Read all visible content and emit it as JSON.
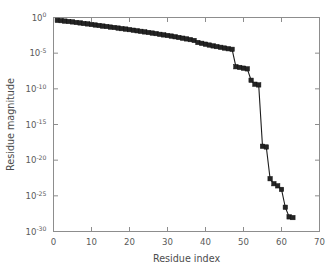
{
  "chart_data": {
    "type": "line",
    "title": "",
    "xlabel": "Residue index",
    "ylabel": "Residue magnitude",
    "xlim": [
      0,
      70
    ],
    "ylim_log10": [
      -30,
      0
    ],
    "yscale": "log",
    "xscale": "linear",
    "grid": false,
    "legend": null,
    "marker": "square",
    "line_color": "#1c1c1c",
    "marker_color": "#242424",
    "xticks": [
      0,
      10,
      20,
      30,
      40,
      50,
      60,
      70
    ],
    "xtick_labels": [
      "0",
      "10",
      "20",
      "30",
      "40",
      "50",
      "60",
      "70"
    ],
    "yticks_log10": [
      0,
      -5,
      -10,
      -15,
      -20,
      -25,
      -30
    ],
    "ytick_labels": [
      "10^0",
      "10^-5",
      "10^-10",
      "10^-15",
      "10^-20",
      "10^-25",
      "10^-30"
    ],
    "ytick_mantissa": "10",
    "ytick_exponents": [
      "0",
      "-5",
      "-10",
      "-15",
      "-20",
      "-25",
      "-30"
    ],
    "x": [
      1,
      2,
      3,
      4,
      5,
      6,
      7,
      8,
      9,
      10,
      11,
      12,
      13,
      14,
      15,
      16,
      17,
      18,
      19,
      20,
      21,
      22,
      23,
      24,
      25,
      26,
      27,
      28,
      29,
      30,
      31,
      32,
      33,
      34,
      35,
      36,
      37,
      38,
      39,
      40,
      41,
      42,
      43,
      44,
      45,
      46,
      47,
      48,
      49,
      50,
      51,
      52,
      53,
      54,
      55,
      56,
      57,
      58,
      59,
      60,
      61,
      62,
      63
    ],
    "y_log10": [
      -0.4,
      -0.44,
      -0.5,
      -0.56,
      -0.62,
      -0.7,
      -0.76,
      -0.84,
      -0.9,
      -0.98,
      -1.05,
      -1.12,
      -1.2,
      -1.26,
      -1.34,
      -1.4,
      -1.48,
      -1.56,
      -1.62,
      -1.7,
      -1.78,
      -1.86,
      -1.94,
      -2.02,
      -2.1,
      -2.18,
      -2.26,
      -2.36,
      -2.44,
      -2.52,
      -2.6,
      -2.7,
      -2.8,
      -2.9,
      -3.0,
      -3.1,
      -3.22,
      -3.5,
      -3.62,
      -3.74,
      -3.86,
      -3.98,
      -4.08,
      -4.18,
      -4.28,
      -4.38,
      -4.46,
      -6.9,
      -7.0,
      -7.1,
      -7.2,
      -8.8,
      -9.35,
      -9.45,
      -18.05,
      -18.15,
      -22.6,
      -23.3,
      -23.6,
      -24.1,
      -26.6,
      -27.95,
      -28.05
    ],
    "y_values": [
      "4.0e-1",
      "3.6e-1",
      "3.2e-1",
      "2.8e-1",
      "2.4e-1",
      "2.0e-1",
      "1.7e-1",
      "1.4e-1",
      "1.3e-1",
      "1.0e-1",
      "8.9e-2",
      "7.6e-2",
      "6.3e-2",
      "5.5e-2",
      "4.6e-2",
      "4.0e-2",
      "3.3e-2",
      "2.8e-2",
      "2.4e-2",
      "2.0e-2",
      "1.7e-2",
      "1.4e-2",
      "1.1e-2",
      "9.5e-3",
      "7.9e-3",
      "6.6e-3",
      "5.5e-3",
      "4.4e-3",
      "3.6e-3",
      "3.0e-3",
      "2.5e-3",
      "2.0e-3",
      "1.6e-3",
      "1.3e-3",
      "1.0e-3",
      "7.9e-4",
      "6.0e-4",
      "3.2e-4",
      "2.4e-4",
      "1.8e-4",
      "1.4e-4",
      "1.0e-4",
      "8.3e-5",
      "6.6e-5",
      "5.2e-5",
      "4.2e-5",
      "3.5e-5",
      "1.3e-7",
      "1.0e-7",
      "7.9e-8",
      "6.3e-8",
      "1.6e-9",
      "4.5e-10",
      "3.5e-10",
      "8.9e-19",
      "7.1e-19",
      "2.5e-23",
      "5.0e-24",
      "2.5e-24",
      "7.9e-25",
      "2.5e-27",
      "1.1e-28",
      "8.9e-29"
    ]
  },
  "figure": {
    "background": "#ffffff",
    "axis_color": "#8d8d8d",
    "text_color": "#4d4d4d"
  }
}
